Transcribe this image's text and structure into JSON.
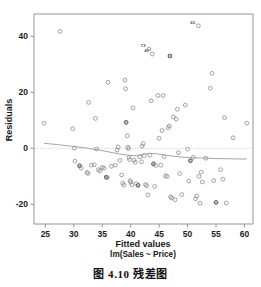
{
  "figure": {
    "caption": "图 4.10  残差图"
  },
  "chart_data": {
    "type": "scatter",
    "title": "Residuals vs Fitted",
    "xlabel": "Fitted values",
    "sublabel": "lm(Sales ~ Price)",
    "ylabel": "Residuals",
    "xlim": [
      23.0,
      61.5
    ],
    "ylim": [
      -27.0,
      48.0
    ],
    "xticks": [
      25,
      30,
      35,
      40,
      45,
      50,
      55,
      60
    ],
    "xticklabels": [
      "25",
      "30",
      "35",
      "40",
      "45",
      "50",
      "55",
      "60"
    ],
    "yticks": [
      -20,
      0,
      20,
      40
    ],
    "yticklabels": [
      "-20",
      "0",
      "20",
      "40"
    ],
    "grid": false,
    "legend": null,
    "reference_line": {
      "type": "horizontal",
      "y": 0,
      "style": "dotted",
      "color": "#c9c9c9"
    },
    "marker_style": "open-circle",
    "points": [
      {
        "x": 24.8,
        "y": 9.0
      },
      {
        "x": 27.6,
        "y": 41.8
      },
      {
        "x": 29.8,
        "y": 7.0
      },
      {
        "x": 30.1,
        "y": 0.1
      },
      {
        "x": 30.2,
        "y": -4.6
      },
      {
        "x": 31.0,
        "y": -6.2
      },
      {
        "x": 31.3,
        "y": -7.0
      },
      {
        "x": 32.3,
        "y": -8.6
      },
      {
        "x": 32.5,
        "y": -8.9
      },
      {
        "x": 32.6,
        "y": 16.4
      },
      {
        "x": 33.1,
        "y": -6.0
      },
      {
        "x": 33.6,
        "y": -5.8
      },
      {
        "x": 33.8,
        "y": 10.7
      },
      {
        "x": 34.0,
        "y": -0.2
      },
      {
        "x": 34.3,
        "y": -7.6
      },
      {
        "x": 34.6,
        "y": -8.0
      },
      {
        "x": 35.0,
        "y": -6.8
      },
      {
        "x": 35.3,
        "y": -7.1
      },
      {
        "x": 35.7,
        "y": -10.3
      },
      {
        "x": 35.9,
        "y": -10.4
      },
      {
        "x": 36.0,
        "y": 23.6
      },
      {
        "x": 36.6,
        "y": -6.4
      },
      {
        "x": 37.3,
        "y": -6.0
      },
      {
        "x": 37.6,
        "y": -0.6
      },
      {
        "x": 37.8,
        "y": 0.5
      },
      {
        "x": 38.1,
        "y": -4.3
      },
      {
        "x": 38.4,
        "y": -9.5
      },
      {
        "x": 38.6,
        "y": -12.4
      },
      {
        "x": 38.8,
        "y": -13.1
      },
      {
        "x": 39.0,
        "y": 24.4
      },
      {
        "x": 39.1,
        "y": 21.3
      },
      {
        "x": 39.2,
        "y": 9.3
      },
      {
        "x": 39.4,
        "y": 4.5
      },
      {
        "x": 39.5,
        "y": 0.4
      },
      {
        "x": 39.6,
        "y": -0.1
      },
      {
        "x": 39.7,
        "y": -3.2
      },
      {
        "x": 39.8,
        "y": -4.0
      },
      {
        "x": 39.9,
        "y": -11.5
      },
      {
        "x": 40.0,
        "y": -12.1
      },
      {
        "x": 40.2,
        "y": -13.0
      },
      {
        "x": 40.4,
        "y": 14.5
      },
      {
        "x": 40.6,
        "y": -4.2
      },
      {
        "x": 40.8,
        "y": -5.0
      },
      {
        "x": 41.0,
        "y": -12.6
      },
      {
        "x": 41.3,
        "y": -13.2
      },
      {
        "x": 41.6,
        "y": -3.0
      },
      {
        "x": 41.9,
        "y": -4.8
      },
      {
        "x": 42.0,
        "y": 0.8
      },
      {
        "x": 42.2,
        "y": 1.7
      },
      {
        "x": 42.4,
        "y": -2.6
      },
      {
        "x": 42.6,
        "y": -12.9
      },
      {
        "x": 42.8,
        "y": -13.3
      },
      {
        "x": 43.0,
        "y": -16.6
      },
      {
        "x": 43.2,
        "y": 35.5
      },
      {
        "x": 43.4,
        "y": -2.4
      },
      {
        "x": 43.6,
        "y": 17.0
      },
      {
        "x": 43.8,
        "y": 33.7
      },
      {
        "x": 44.0,
        "y": -5.5
      },
      {
        "x": 44.2,
        "y": -13.6
      },
      {
        "x": 44.4,
        "y": -6.1
      },
      {
        "x": 44.8,
        "y": 18.9
      },
      {
        "x": 45.0,
        "y": 3.6
      },
      {
        "x": 45.3,
        "y": -6.0
      },
      {
        "x": 45.5,
        "y": 6.4
      },
      {
        "x": 45.7,
        "y": 18.9
      },
      {
        "x": 45.9,
        "y": -2.9
      },
      {
        "x": 46.1,
        "y": -9.8
      },
      {
        "x": 46.4,
        "y": -10.0
      },
      {
        "x": 46.6,
        "y": 7.4
      },
      {
        "x": 46.8,
        "y": 8.0
      },
      {
        "x": 46.9,
        "y": 33.0
      },
      {
        "x": 47.0,
        "y": -17.3
      },
      {
        "x": 47.2,
        "y": -17.7
      },
      {
        "x": 47.5,
        "y": 11.2
      },
      {
        "x": 47.8,
        "y": -18.3
      },
      {
        "x": 48.0,
        "y": 10.5
      },
      {
        "x": 48.2,
        "y": 14.0
      },
      {
        "x": 48.4,
        "y": -1.5
      },
      {
        "x": 48.6,
        "y": -9.0
      },
      {
        "x": 49.0,
        "y": -16.5
      },
      {
        "x": 49.6,
        "y": 15.5
      },
      {
        "x": 50.0,
        "y": -0.3
      },
      {
        "x": 50.2,
        "y": -11.7
      },
      {
        "x": 50.5,
        "y": -4.4
      },
      {
        "x": 51.0,
        "y": -3.2
      },
      {
        "x": 51.4,
        "y": -18.0
      },
      {
        "x": 51.6,
        "y": -17.0
      },
      {
        "x": 51.9,
        "y": 43.8
      },
      {
        "x": 52.0,
        "y": -10.0
      },
      {
        "x": 52.2,
        "y": -19.6
      },
      {
        "x": 52.4,
        "y": -8.5
      },
      {
        "x": 52.6,
        "y": -12.0
      },
      {
        "x": 53.2,
        "y": -3.5
      },
      {
        "x": 54.0,
        "y": 21.5
      },
      {
        "x": 54.3,
        "y": 26.8
      },
      {
        "x": 54.6,
        "y": -11.5
      },
      {
        "x": 55.0,
        "y": -19.3
      },
      {
        "x": 55.8,
        "y": -7.6
      },
      {
        "x": 56.2,
        "y": -11.0
      },
      {
        "x": 56.5,
        "y": 11.0
      },
      {
        "x": 56.8,
        "y": -19.5
      },
      {
        "x": 58.0,
        "y": 3.8
      },
      {
        "x": 60.4,
        "y": 9.0
      }
    ],
    "annotations": [
      {
        "label": "72",
        "x": 43.2,
        "y": 35.5
      },
      {
        "label": "47",
        "x": 43.8,
        "y": 33.7
      },
      {
        "label": "43",
        "x": 51.9,
        "y": 43.8
      }
    ],
    "smoother": {
      "name": "lowess",
      "x": [
        24.8,
        27.0,
        29.5,
        32.0,
        34.5,
        36.5,
        38.0,
        39.5,
        40.5,
        41.5,
        42.5,
        43.5,
        44.5,
        45.5,
        46.5,
        48.0,
        49.5,
        51.0,
        52.5,
        54.5,
        57.0,
        60.4
      ],
      "y": [
        1.8,
        1.4,
        0.8,
        0.2,
        -0.6,
        -1.4,
        -2.0,
        -2.4,
        -2.6,
        -2.4,
        -2.0,
        -1.8,
        -1.9,
        -2.2,
        -2.5,
        -2.9,
        -3.2,
        -3.4,
        -3.4,
        -3.6,
        -3.7,
        -3.8
      ]
    }
  }
}
